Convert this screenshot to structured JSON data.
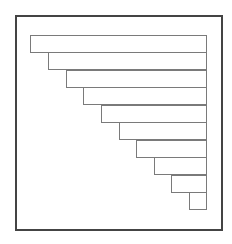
{
  "diagram": {
    "type": "staircase",
    "frame": {
      "x": 15,
      "y": 15,
      "width": 208,
      "height": 216,
      "stroke": "#444444"
    },
    "bar_stroke": "#7a7a7a",
    "right_edge": 207,
    "bars": [
      {
        "x": 30,
        "y": 35,
        "h": 18
      },
      {
        "x": 48,
        "y": 52,
        "h": 18
      },
      {
        "x": 66,
        "y": 70,
        "h": 18
      },
      {
        "x": 83,
        "y": 87,
        "h": 18
      },
      {
        "x": 101,
        "y": 105,
        "h": 18
      },
      {
        "x": 119,
        "y": 122,
        "h": 18
      },
      {
        "x": 136,
        "y": 140,
        "h": 18
      },
      {
        "x": 154,
        "y": 157,
        "h": 18
      },
      {
        "x": 171,
        "y": 175,
        "h": 18
      },
      {
        "x": 189,
        "y": 192,
        "h": 18
      }
    ]
  }
}
